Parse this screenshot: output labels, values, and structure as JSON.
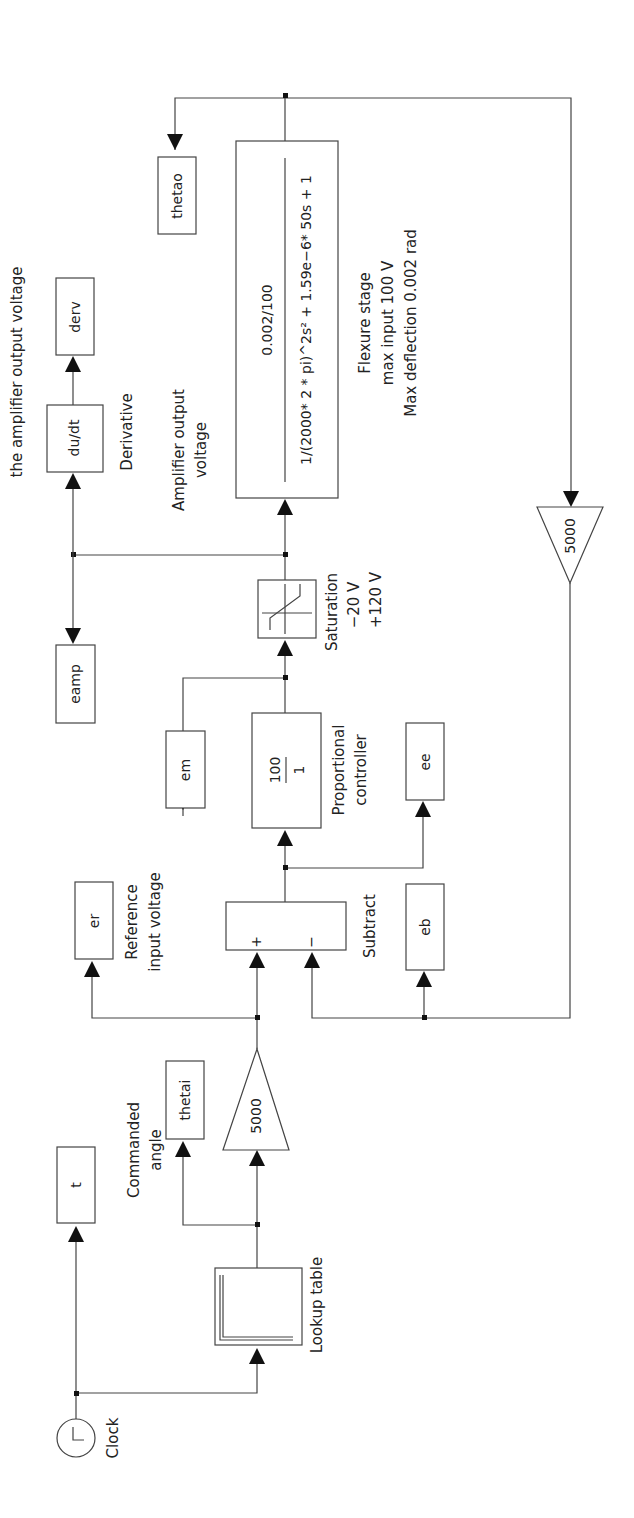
{
  "diagram": {
    "type": "simulink-block-diagram",
    "orientation": "rotated-90-ccw",
    "annotation_top": "the amplifier output voltage",
    "blocks": {
      "clock": {
        "label": "Clock"
      },
      "t_out": {
        "label": "t"
      },
      "lookup": {
        "label": "Lookup table"
      },
      "thetai_out": {
        "label": "thetai"
      },
      "commanded_angle_label": {
        "line1": "Commanded",
        "line2": "angle"
      },
      "gain_in": {
        "value": "5000"
      },
      "er_out": {
        "label": "er"
      },
      "reference_label": {
        "line1": "Reference",
        "line2": "input voltage"
      },
      "subtract": {
        "label": "Subtract",
        "plus": "+",
        "minus": "−"
      },
      "eb_out": {
        "label": "eb"
      },
      "ee_out": {
        "label": "ee"
      },
      "controller": {
        "numerator": "100",
        "denominator": "1",
        "label1": "Proportional",
        "label2": "controller"
      },
      "em_out": {
        "label": "em"
      },
      "saturation": {
        "label": "Saturation",
        "lower": "−20 V",
        "upper": "+120 V"
      },
      "eamp_out": {
        "label": "eamp"
      },
      "amp_label": {
        "line1": "Amplifier output",
        "line2": "voltage"
      },
      "derivative": {
        "expr": "du/dt",
        "label": "Derivative"
      },
      "derv_out": {
        "label": "derv"
      },
      "flexure": {
        "numerator": "0.002/100",
        "denominator": "1/(2000* 2 * pi)^2s² + 1.59e−6* 50s + 1",
        "label1": "Flexure stage",
        "label2": "max input 100 V",
        "label3": "Max deflection 0.002 rad"
      },
      "thetao_out": {
        "label": "thetao"
      },
      "gain_fb": {
        "value": "5000"
      }
    }
  }
}
